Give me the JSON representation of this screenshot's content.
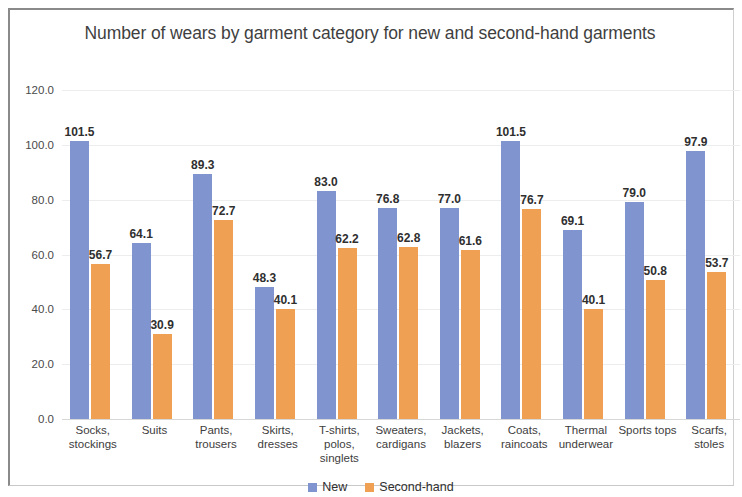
{
  "chart_data": {
    "type": "bar",
    "title": "Number of wears by garment category for new and second-hand garments",
    "xlabel": "",
    "ylabel": "",
    "ylim": [
      0,
      120
    ],
    "ytick_step": 20,
    "ytick_labels": [
      "120.0",
      "100.0",
      "80.0",
      "60.0",
      "40.0",
      "20.0",
      "0.0"
    ],
    "grid": true,
    "legend_position": "bottom",
    "categories": [
      "Socks, stockings",
      "Suits",
      "Pants, trousers",
      "Skirts, dresses",
      "T-shirts, polos, singlets",
      "Sweaters, cardigans",
      "Jackets, blazers",
      "Coats, raincoats",
      "Thermal underwear",
      "Sports tops",
      "Scarfs, stoles"
    ],
    "category_lines": [
      [
        "Socks,",
        "stockings"
      ],
      [
        "Suits"
      ],
      [
        "Pants,",
        "trousers"
      ],
      [
        "Skirts,",
        "dresses"
      ],
      [
        "T-shirts,",
        "polos,",
        "singlets"
      ],
      [
        "Sweaters,",
        "cardigans"
      ],
      [
        "Jackets,",
        "blazers"
      ],
      [
        "Coats,",
        "raincoats"
      ],
      [
        "Thermal",
        "underwear"
      ],
      [
        "Sports tops"
      ],
      [
        "Scarfs,",
        "stoles"
      ]
    ],
    "series": [
      {
        "name": "New",
        "color": "#8094cf",
        "values": [
          101.5,
          64.1,
          89.3,
          48.3,
          83.0,
          76.8,
          77.0,
          101.5,
          69.1,
          79.0,
          97.9
        ],
        "labels": [
          "101.5",
          "64.1",
          "89.3",
          "48.3",
          "83.0",
          "76.8",
          "77.0",
          "101.5",
          "69.1",
          "79.0",
          "97.9"
        ]
      },
      {
        "name": "Second-hand",
        "color": "#efa052",
        "values": [
          56.7,
          30.9,
          72.7,
          40.1,
          62.2,
          62.8,
          61.6,
          76.7,
          40.1,
          50.8,
          53.7
        ],
        "labels": [
          "56.7",
          "30.9",
          "72.7",
          "40.1",
          "62.2",
          "62.8",
          "61.6",
          "76.7",
          "40.1",
          "50.8",
          "53.7"
        ]
      }
    ]
  },
  "legend": {
    "items": [
      {
        "label": "New",
        "color": "#8094cf"
      },
      {
        "label": "Second-hand",
        "color": "#efa052"
      }
    ]
  }
}
